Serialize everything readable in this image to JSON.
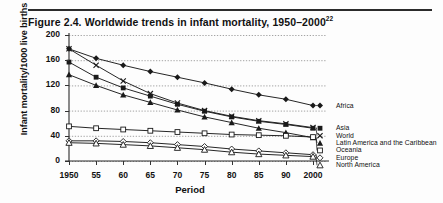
{
  "figure": {
    "title": "Figure 2.4.   Worldwide trends in infant mortality, 1950–2000",
    "superscript": "22"
  },
  "chart_data": {
    "type": "line",
    "title": "Worldwide trends in infant mortality, 1950–2000",
    "xlabel": "Period",
    "ylabel": "Infant mortality/1000 live births",
    "x": [
      1950,
      1955,
      1960,
      1965,
      1970,
      1975,
      1980,
      1985,
      1990,
      2000
    ],
    "tick_labels": [
      "1950",
      "55",
      "60",
      "65",
      "70",
      "75",
      "80",
      "85",
      "90",
      "2000"
    ],
    "xlim": [
      1950,
      2000
    ],
    "ylim": [
      0,
      200
    ],
    "yticks": [
      0,
      40,
      80,
      120,
      160,
      200
    ],
    "grid": true,
    "grid_style": "dotted-horizontal",
    "legend_position": "right",
    "series": [
      {
        "name": "Africa",
        "marker": "filled-diamond",
        "color": "#1a1a1a",
        "values": [
          178,
          163,
          152,
          142,
          133,
          124,
          114,
          105,
          98,
          88
        ]
      },
      {
        "name": "Asia",
        "marker": "filled-square",
        "color": "#1a1a1a",
        "values": [
          157,
          133,
          116,
          103,
          90,
          79,
          70,
          63,
          58,
          52
        ]
      },
      {
        "name": "World",
        "marker": "cross-x",
        "color": "#1a1a1a",
        "values": [
          178,
          152,
          127,
          107,
          92,
          80,
          71,
          64,
          59,
          53
        ]
      },
      {
        "name": "Latin America and the Caribbean",
        "marker": "filled-triangle",
        "color": "#1a1a1a",
        "values": [
          137,
          120,
          105,
          93,
          81,
          70,
          61,
          52,
          45,
          37
        ]
      },
      {
        "name": "Oceania",
        "marker": "open-square",
        "color": "#1a1a1a",
        "values": [
          55,
          52,
          50,
          48,
          46,
          44,
          42,
          41,
          40,
          38
        ]
      },
      {
        "name": "Europe",
        "marker": "open-diamond",
        "color": "#1a1a1a",
        "values": [
          32,
          32,
          31,
          29,
          26,
          23,
          19,
          16,
          13,
          10
        ]
      },
      {
        "name": "North America",
        "marker": "open-triangle",
        "color": "#1a1a1a",
        "values": [
          29,
          28,
          26,
          24,
          21,
          18,
          14,
          11,
          9,
          7
        ]
      }
    ]
  },
  "axes": {
    "y_ticks": [
      "200",
      "160",
      "120",
      "80",
      "40",
      "0"
    ],
    "x_ticks": [
      "1950",
      "55",
      "60",
      "65",
      "70",
      "75",
      "80",
      "85",
      "90",
      "2000"
    ],
    "y_title": "Infant mortality/1000 live births",
    "x_title": "Period"
  },
  "legend": {
    "entries": [
      {
        "label": "Africa"
      },
      {
        "label": "Asia"
      },
      {
        "label": "World"
      },
      {
        "label": "Latin America and the Caribbean"
      },
      {
        "label": "Oceania"
      },
      {
        "label": "Europe"
      },
      {
        "label": "North America"
      }
    ]
  }
}
